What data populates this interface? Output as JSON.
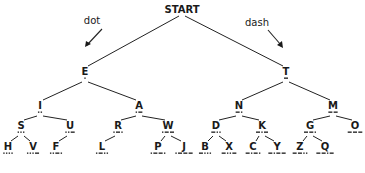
{
  "diagram": {
    "root_label": "START",
    "direction_labels": {
      "left": "dot",
      "right": "dash"
    },
    "caption": "",
    "nodes": [
      {
        "id": "START",
        "label": "START",
        "code": "",
        "x": 182,
        "y": 13
      },
      {
        "id": "E",
        "label": "E",
        "code": ".",
        "x": 85,
        "y": 75,
        "parent": "START"
      },
      {
        "id": "T",
        "label": "T",
        "code": "-",
        "x": 286,
        "y": 75,
        "parent": "START"
      },
      {
        "id": "I",
        "label": "I",
        "code": "..",
        "x": 40,
        "y": 109,
        "parent": "E"
      },
      {
        "id": "A",
        "label": "A",
        "code": ".-",
        "x": 139,
        "y": 109,
        "parent": "E"
      },
      {
        "id": "N",
        "label": "N",
        "code": "-.",
        "x": 239,
        "y": 109,
        "parent": "T"
      },
      {
        "id": "M",
        "label": "M",
        "code": "--",
        "x": 333,
        "y": 109,
        "parent": "T"
      },
      {
        "id": "S",
        "label": "S",
        "code": "...",
        "x": 21,
        "y": 129,
        "parent": "I"
      },
      {
        "id": "U",
        "label": "U",
        "code": "..-",
        "x": 70,
        "y": 129,
        "parent": "I"
      },
      {
        "id": "R",
        "label": "R",
        "code": ".-.",
        "x": 118,
        "y": 129,
        "parent": "A"
      },
      {
        "id": "W",
        "label": "W",
        "code": ".--",
        "x": 168,
        "y": 129,
        "parent": "A"
      },
      {
        "id": "D",
        "label": "D",
        "code": "-..",
        "x": 216,
        "y": 129,
        "parent": "N"
      },
      {
        "id": "K",
        "label": "K",
        "code": "-.-",
        "x": 262,
        "y": 129,
        "parent": "N"
      },
      {
        "id": "G",
        "label": "G",
        "code": "--.",
        "x": 310,
        "y": 129,
        "parent": "M"
      },
      {
        "id": "O",
        "label": "O",
        "code": "---",
        "x": 355,
        "y": 129,
        "parent": "M"
      },
      {
        "id": "H",
        "label": "H",
        "code": "....",
        "x": 8,
        "y": 150,
        "parent": "S"
      },
      {
        "id": "V",
        "label": "V",
        "code": "...-",
        "x": 33,
        "y": 150,
        "parent": "S"
      },
      {
        "id": "F",
        "label": "F",
        "code": "..-.",
        "x": 56,
        "y": 150,
        "parent": "U"
      },
      {
        "id": "L",
        "label": "L",
        "code": ".-..",
        "x": 102,
        "y": 150,
        "parent": "R"
      },
      {
        "id": "P",
        "label": "P",
        "code": ".--.",
        "x": 158,
        "y": 150,
        "parent": "W"
      },
      {
        "id": "J",
        "label": "J",
        "code": ".---",
        "x": 184,
        "y": 150,
        "parent": "W"
      },
      {
        "id": "B",
        "label": "B",
        "code": "-...",
        "x": 205,
        "y": 150,
        "parent": "D"
      },
      {
        "id": "X",
        "label": "X",
        "code": "-..-",
        "x": 229,
        "y": 150,
        "parent": "D"
      },
      {
        "id": "C",
        "label": "C",
        "code": "-.-.",
        "x": 253,
        "y": 150,
        "parent": "K"
      },
      {
        "id": "Y",
        "label": "Y",
        "code": "-.--",
        "x": 277,
        "y": 150,
        "parent": "K"
      },
      {
        "id": "Z",
        "label": "Z",
        "code": "--..",
        "x": 300,
        "y": 150,
        "parent": "G"
      },
      {
        "id": "Q",
        "label": "Q",
        "code": "--.-",
        "x": 325,
        "y": 150,
        "parent": "G"
      }
    ],
    "colors": {
      "ink": "#1a1a1a",
      "background": "#ffffff"
    }
  }
}
